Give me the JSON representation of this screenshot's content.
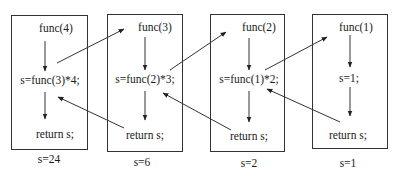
{
  "diagram": {
    "type": "recursion-call-trace",
    "frames": [
      {
        "call": "func(4)",
        "statement": "s=func(3)*4;",
        "return": "return s;",
        "result": "s=24"
      },
      {
        "call": "func(3)",
        "statement": "s=func(2)*3;",
        "return": "return s;",
        "result": "s=6"
      },
      {
        "call": "func(2)",
        "statement": "s=func(1)*2;",
        "return": "return s;",
        "result": "s=2"
      },
      {
        "call": "func(1)",
        "statement": "s=1;",
        "return": "return s;",
        "result": "s=1"
      }
    ],
    "edges": [
      {
        "from": "frame0.statement",
        "to": "frame1.call",
        "kind": "call"
      },
      {
        "from": "frame1.statement",
        "to": "frame2.call",
        "kind": "call"
      },
      {
        "from": "frame2.statement",
        "to": "frame3.call",
        "kind": "call"
      },
      {
        "from": "frame3.return",
        "to": "frame2.statement",
        "kind": "return"
      },
      {
        "from": "frame2.return",
        "to": "frame1.statement",
        "kind": "return"
      },
      {
        "from": "frame1.return",
        "to": "frame0.statement",
        "kind": "return"
      }
    ],
    "colors": {
      "line": "#333333",
      "text": "#1a1a1a",
      "background": "#ffffff"
    }
  }
}
